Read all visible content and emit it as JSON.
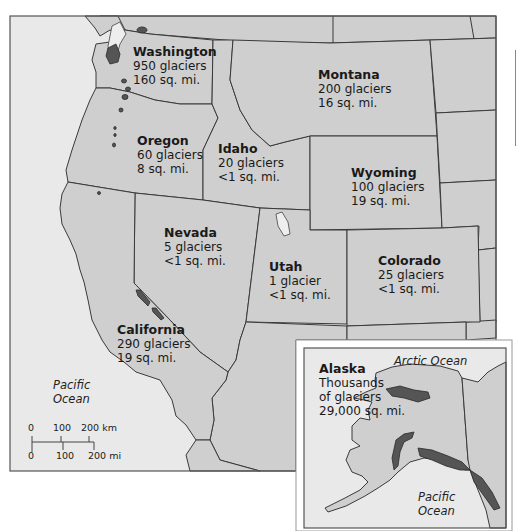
{
  "map": {
    "title": "Glaciers of the western United States",
    "states": [
      {
        "name": "Washington",
        "glaciers": "950 glaciers",
        "area": "160 sq. mi."
      },
      {
        "name": "Montana",
        "glaciers": "200 glaciers",
        "area": "16 sq. mi."
      },
      {
        "name": "Oregon",
        "glaciers": "60 glaciers",
        "area": "8 sq. mi."
      },
      {
        "name": "Idaho",
        "glaciers": "20 glaciers",
        "area": "<1 sq. mi."
      },
      {
        "name": "Wyoming",
        "glaciers": "100 glaciers",
        "area": "19 sq. mi."
      },
      {
        "name": "Nevada",
        "glaciers": "5 glaciers",
        "area": "<1 sq. mi."
      },
      {
        "name": "Utah",
        "glaciers": "1 glacier",
        "area": "<1 sq. mi."
      },
      {
        "name": "Colorado",
        "glaciers": "25 glaciers",
        "area": "<1 sq. mi."
      },
      {
        "name": "California",
        "glaciers": "290 glaciers",
        "area": "19 sq. mi."
      }
    ],
    "alaska": {
      "name": "Alaska",
      "line1": "Thousands",
      "line2": "of glaciers",
      "area": "29,000 sq. mi."
    },
    "oceans": {
      "pacific_main": [
        "Pacific",
        "Ocean"
      ],
      "pacific_inset": [
        "Pacific",
        "Ocean"
      ],
      "arctic_inset": "Arctic Ocean"
    },
    "scale": {
      "km_ticks": [
        "0",
        "100",
        "200 km"
      ],
      "mi_ticks": [
        "0",
        "100",
        "200 mi"
      ]
    },
    "colors": {
      "land": "#cfcfcf",
      "ocean": "#e9e9e9",
      "glacier": "#555555",
      "border": "#3a3a3a"
    }
  }
}
